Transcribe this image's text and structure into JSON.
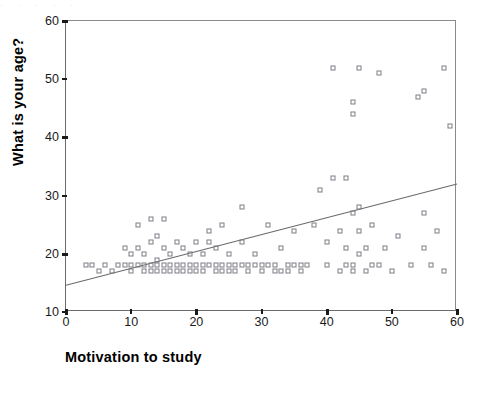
{
  "page": {
    "top_artifact_text": "· · · · ·"
  },
  "chart_data": {
    "type": "scatter",
    "title": "",
    "xlabel": "Motivation to study",
    "ylabel": "What is your age?",
    "xlim": [
      0,
      60
    ],
    "ylim": [
      10,
      60
    ],
    "xticks": [
      0,
      10,
      20,
      30,
      40,
      50,
      60
    ],
    "yticks": [
      10,
      20,
      30,
      40,
      50,
      60
    ],
    "xtick_labels": [
      "0",
      "10",
      "20",
      "30",
      "40",
      "50",
      "60"
    ],
    "ytick_labels": [
      "10",
      "20",
      "30",
      "40",
      "50",
      "60"
    ],
    "grid": false,
    "legend": null,
    "marker": "open-square",
    "marker_color": "#7d7d85",
    "line_color": "#6b6b6b",
    "fit_line": {
      "type": "linear",
      "x": [
        0,
        60
      ],
      "y": [
        14.6,
        32.0
      ]
    },
    "points": [
      [
        3,
        18
      ],
      [
        4,
        18
      ],
      [
        5,
        17
      ],
      [
        6,
        18
      ],
      [
        7,
        17
      ],
      [
        8,
        18
      ],
      [
        9,
        18
      ],
      [
        9,
        21
      ],
      [
        10,
        18
      ],
      [
        10,
        17
      ],
      [
        10,
        20
      ],
      [
        11,
        18
      ],
      [
        11,
        21
      ],
      [
        11,
        25
      ],
      [
        12,
        18
      ],
      [
        12,
        17
      ],
      [
        12,
        20
      ],
      [
        13,
        17
      ],
      [
        13,
        18
      ],
      [
        13,
        22
      ],
      [
        13,
        26
      ],
      [
        14,
        17
      ],
      [
        14,
        18
      ],
      [
        14,
        19
      ],
      [
        14,
        23
      ],
      [
        15,
        17
      ],
      [
        15,
        18
      ],
      [
        15,
        21
      ],
      [
        15,
        26
      ],
      [
        16,
        18
      ],
      [
        16,
        17
      ],
      [
        16,
        20
      ],
      [
        17,
        18
      ],
      [
        17,
        17
      ],
      [
        17,
        22
      ],
      [
        18,
        18
      ],
      [
        18,
        17
      ],
      [
        18,
        21
      ],
      [
        19,
        18
      ],
      [
        19,
        17
      ],
      [
        19,
        20
      ],
      [
        20,
        18
      ],
      [
        20,
        17
      ],
      [
        20,
        22
      ],
      [
        21,
        18
      ],
      [
        21,
        17
      ],
      [
        21,
        20
      ],
      [
        22,
        18
      ],
      [
        22,
        22
      ],
      [
        22,
        24
      ],
      [
        23,
        18
      ],
      [
        23,
        17
      ],
      [
        23,
        21
      ],
      [
        24,
        18
      ],
      [
        24,
        17
      ],
      [
        24,
        25
      ],
      [
        25,
        18
      ],
      [
        25,
        17
      ],
      [
        25,
        20
      ],
      [
        26,
        18
      ],
      [
        26,
        17
      ],
      [
        27,
        18
      ],
      [
        27,
        22
      ],
      [
        27,
        28
      ],
      [
        28,
        18
      ],
      [
        28,
        17
      ],
      [
        29,
        18
      ],
      [
        29,
        20
      ],
      [
        30,
        17
      ],
      [
        30,
        18
      ],
      [
        31,
        18
      ],
      [
        31,
        25
      ],
      [
        32,
        17
      ],
      [
        32,
        18
      ],
      [
        33,
        17
      ],
      [
        33,
        21
      ],
      [
        34,
        17
      ],
      [
        34,
        18
      ],
      [
        35,
        18
      ],
      [
        35,
        24
      ],
      [
        36,
        17
      ],
      [
        36,
        18
      ],
      [
        37,
        18
      ],
      [
        38,
        25
      ],
      [
        39,
        31
      ],
      [
        40,
        18
      ],
      [
        40,
        22
      ],
      [
        41,
        52
      ],
      [
        41,
        33
      ],
      [
        42,
        17
      ],
      [
        42,
        24
      ],
      [
        43,
        18
      ],
      [
        43,
        21
      ],
      [
        43,
        33
      ],
      [
        44,
        17
      ],
      [
        44,
        18
      ],
      [
        44,
        44
      ],
      [
        44,
        46
      ],
      [
        44,
        27
      ],
      [
        45,
        20
      ],
      [
        45,
        24
      ],
      [
        45,
        28
      ],
      [
        45,
        52
      ],
      [
        46,
        17
      ],
      [
        46,
        21
      ],
      [
        47,
        18
      ],
      [
        47,
        25
      ],
      [
        48,
        51
      ],
      [
        48,
        18
      ],
      [
        49,
        21
      ],
      [
        50,
        17
      ],
      [
        51,
        23
      ],
      [
        53,
        18
      ],
      [
        54,
        47
      ],
      [
        55,
        48
      ],
      [
        55,
        27
      ],
      [
        55,
        21
      ],
      [
        56,
        18
      ],
      [
        57,
        24
      ],
      [
        58,
        52
      ],
      [
        58,
        17
      ],
      [
        59,
        42
      ]
    ]
  }
}
